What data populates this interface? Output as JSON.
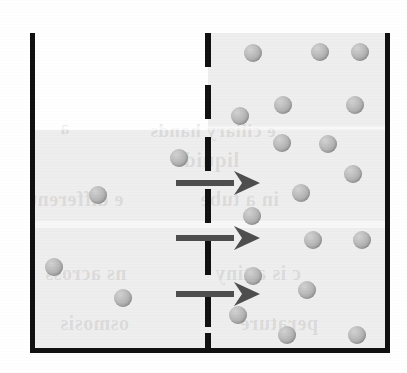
{
  "figure": {
    "width": 407,
    "height": 373,
    "background_color": "#ffffff"
  },
  "container": {
    "name": "beaker",
    "wall_color": "#111111",
    "wall_thickness": 5,
    "left_wall": {
      "x": 30,
      "y": 33,
      "w": 5,
      "h": 320
    },
    "right_wall": {
      "x": 385,
      "y": 33,
      "w": 5,
      "h": 320
    },
    "bottom_wall": {
      "x": 30,
      "y": 348,
      "w": 360,
      "h": 5
    }
  },
  "compartments": [
    {
      "name": "left-compartment",
      "label": "dilute solution",
      "liquid_color": "#eeeeee",
      "liquid_level_y": 130,
      "rect": {
        "x": 35,
        "y": 130,
        "w": 173,
        "h": 218
      },
      "particle_count": 4
    },
    {
      "name": "right-compartment",
      "label": "concentrated solution",
      "liquid_color": "#eeeeee",
      "liquid_level_y": 33,
      "rect": {
        "x": 208,
        "y": 33,
        "w": 177,
        "h": 315
      },
      "particle_count": 18
    }
  ],
  "membrane": {
    "name": "semipermeable-membrane",
    "style": "dashed",
    "color": "#111111",
    "x": 205,
    "width": 6,
    "dashes": [
      {
        "top": 0,
        "height": 34
      },
      {
        "top": 52,
        "height": 34
      },
      {
        "top": 104,
        "height": 34
      },
      {
        "top": 156,
        "height": 34
      },
      {
        "top": 208,
        "height": 34
      },
      {
        "top": 260,
        "height": 34
      },
      {
        "top": 300,
        "height": 20
      }
    ]
  },
  "arrows": {
    "color": "#4e4e4e",
    "direction": "left-to-right",
    "meaning": "net water flow",
    "items": [
      {
        "x": 176,
        "y": 171,
        "shaft_width": 58
      },
      {
        "x": 176,
        "y": 226,
        "shaft_width": 58
      },
      {
        "x": 176,
        "y": 282,
        "shaft_width": 58
      }
    ]
  },
  "particles": {
    "name": "solute-particle",
    "color": "#b0b0b0",
    "diameter": 18,
    "left": [
      {
        "cx": 179,
        "cy": 158
      },
      {
        "cx": 98,
        "cy": 195
      },
      {
        "cx": 54,
        "cy": 267
      },
      {
        "cx": 123,
        "cy": 298
      }
    ],
    "right": [
      {
        "cx": 253,
        "cy": 53
      },
      {
        "cx": 320,
        "cy": 52
      },
      {
        "cx": 360,
        "cy": 52
      },
      {
        "cx": 283,
        "cy": 105
      },
      {
        "cx": 355,
        "cy": 105
      },
      {
        "cx": 240,
        "cy": 116
      },
      {
        "cx": 282,
        "cy": 143
      },
      {
        "cx": 328,
        "cy": 144
      },
      {
        "cx": 353,
        "cy": 174
      },
      {
        "cx": 301,
        "cy": 193
      },
      {
        "cx": 252,
        "cy": 216
      },
      {
        "cx": 313,
        "cy": 240
      },
      {
        "cx": 362,
        "cy": 240
      },
      {
        "cx": 253,
        "cy": 276
      },
      {
        "cx": 307,
        "cy": 290
      },
      {
        "cx": 238,
        "cy": 315
      },
      {
        "cx": 287,
        "cy": 335
      },
      {
        "cx": 357,
        "cy": 335
      }
    ]
  },
  "scan_artifacts": {
    "bleed_through_text": [
      {
        "text": "e ciliary hands",
        "x": 150,
        "y": 120,
        "size": 19
      },
      {
        "text": "liquids",
        "x": 175,
        "y": 148,
        "size": 21
      },
      {
        "text": "a",
        "x": 60,
        "y": 118,
        "size": 18
      },
      {
        "text": "e different",
        "x": 30,
        "y": 188,
        "size": 20
      },
      {
        "text": "in a tube",
        "x": 200,
        "y": 188,
        "size": 20
      },
      {
        "text": "ns across",
        "x": 45,
        "y": 262,
        "size": 20
      },
      {
        "text": "c is a tiny",
        "x": 215,
        "y": 262,
        "size": 20
      },
      {
        "text": "osmosis",
        "x": 60,
        "y": 312,
        "size": 20
      },
      {
        "text": "perature",
        "x": 240,
        "y": 312,
        "size": 20
      }
    ]
  }
}
